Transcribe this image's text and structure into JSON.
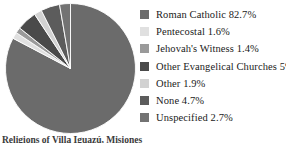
{
  "chart_data": {
    "type": "pie",
    "title": "",
    "subtitle": "",
    "xlabel": "",
    "ylabel": "",
    "grid": false,
    "legend_position": "right",
    "start_angle_deg": -90,
    "direction": "clockwise",
    "categories": [
      "Roman Catholic",
      "Pentecostal",
      "Jehovah's Witness",
      "Other Evangelical Churches",
      "Other",
      "None",
      "Unspecified"
    ],
    "values": [
      82.7,
      1.6,
      1.4,
      5,
      1.9,
      4.7,
      2.7
    ],
    "value_unit": "%",
    "colors": [
      "#6b6b6b",
      "#e0e0e0",
      "#9a9a9a",
      "#4a4a4a",
      "#d2d2d2",
      "#5c5c5c",
      "#737373"
    ],
    "slices": [
      {
        "label": "Roman Catholic",
        "value": 82.7,
        "display": "82.7%",
        "color": "#6b6b6b"
      },
      {
        "label": "Pentecostal",
        "value": 1.6,
        "display": "1.6%",
        "color": "#e0e0e0"
      },
      {
        "label": "Jehovah's Witness",
        "value": 1.4,
        "display": "1.4%",
        "color": "#9a9a9a"
      },
      {
        "label": "Other Evangelical Churches",
        "value": 5,
        "display": "5%",
        "color": "#4a4a4a"
      },
      {
        "label": "Other",
        "value": 1.9,
        "display": "1.9%",
        "color": "#d2d2d2"
      },
      {
        "label": "None",
        "value": 4.7,
        "display": "4.7%",
        "color": "#5c5c5c"
      },
      {
        "label": "Unspecified",
        "value": 2.7,
        "display": "2.7%",
        "color": "#737373"
      }
    ]
  },
  "legend": {
    "items": [
      {
        "label": "Roman Catholic 82.7%",
        "color": "#6b6b6b"
      },
      {
        "label": "Pentecostal 1.6%",
        "color": "#e0e0e0"
      },
      {
        "label": "Jehovah's Witness 1.4%",
        "color": "#9a9a9a"
      },
      {
        "label": "Other Evangelical Churches 5%",
        "color": "#4a4a4a"
      },
      {
        "label": "Other 1.9%",
        "color": "#d2d2d2"
      },
      {
        "label": "None 4.7%",
        "color": "#5c5c5c"
      },
      {
        "label": "Unspecified 2.7%",
        "color": "#737373"
      }
    ]
  },
  "caption": {
    "text": "Religions of Villa Iguazú, Misiones"
  }
}
